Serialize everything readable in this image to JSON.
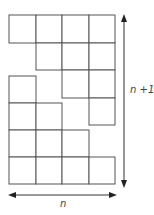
{
  "diagram": {
    "n": 4,
    "upper_staircase": {
      "rows": [
        {
          "cols": [
            0,
            1,
            2,
            3
          ]
        },
        {
          "cols": [
            1,
            2,
            3
          ]
        },
        {
          "cols": [
            2,
            3
          ]
        },
        {
          "cols": [
            3
          ]
        }
      ]
    },
    "lower_staircase": {
      "rows": [
        {
          "cols": [
            0
          ]
        },
        {
          "cols": [
            0,
            1
          ]
        },
        {
          "cols": [
            0,
            1,
            2
          ]
        },
        {
          "cols": [
            0,
            1,
            2,
            3
          ]
        }
      ]
    },
    "labels": {
      "height": "n +1",
      "width": "n"
    },
    "colors": {
      "stroke": "#555555",
      "arrow": "#333333",
      "text": "#444444"
    }
  }
}
